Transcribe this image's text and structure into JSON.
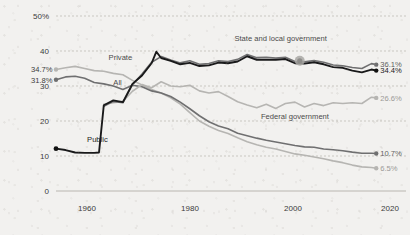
{
  "chart_data": {
    "type": "line",
    "title": "",
    "subtitle": "",
    "xlabel": "",
    "ylabel": "",
    "xlim": [
      1954,
      2022
    ],
    "ylim": [
      0,
      50
    ],
    "grid": true,
    "grid_style": "dashed-horizontal",
    "legend_position": "inline-annotations",
    "y_ticks": [
      "50%",
      "40",
      "30",
      "20",
      "10",
      "0"
    ],
    "y_tick_values": [
      50,
      40,
      30,
      20,
      10,
      0
    ],
    "x_ticks": [
      "1960",
      "1980",
      "2000",
      "2020"
    ],
    "x_tick_values": [
      1960,
      1980,
      2000,
      2020
    ],
    "series": [
      {
        "name": "Private",
        "color": "#b6b5b2",
        "style": "light",
        "start_label": "34.7%",
        "start_value": 34.7,
        "end_label": "6.5%",
        "end_value": 6.5,
        "inline_label": "Private",
        "x": [
          1954,
          1956,
          1958,
          1960,
          1962,
          1964,
          1966,
          1968,
          1970,
          1972,
          1974,
          1976,
          1978,
          1980,
          1982,
          1984,
          1986,
          1988,
          1990,
          1992,
          1994,
          1996,
          1998,
          2000,
          2002,
          2004,
          2006,
          2008,
          2010,
          2012,
          2014,
          2016,
          2018,
          2020,
          2021
        ],
        "values": [
          34.7,
          35.2,
          35.6,
          35.0,
          34.4,
          34.2,
          33.6,
          33.2,
          31.6,
          30.3,
          29.0,
          28.0,
          26.6,
          24.8,
          22.4,
          20.0,
          18.5,
          17.3,
          16.4,
          15.2,
          14.1,
          13.2,
          12.5,
          12.0,
          11.3,
          10.6,
          10.2,
          9.7,
          9.2,
          8.6,
          8.1,
          7.4,
          6.9,
          6.7,
          6.5
        ]
      },
      {
        "name": "All",
        "color": "#6f6f70",
        "style": "mid",
        "start_label": "31.8%",
        "start_value": 31.8,
        "end_label": "10.7%",
        "end_value": 10.7,
        "inline_label": "All",
        "x": [
          1954,
          1956,
          1958,
          1960,
          1962,
          1964,
          1966,
          1968,
          1970,
          1972,
          1974,
          1976,
          1978,
          1980,
          1982,
          1984,
          1986,
          1988,
          1990,
          1992,
          1994,
          1996,
          1998,
          2000,
          2002,
          2004,
          2006,
          2008,
          2010,
          2012,
          2014,
          2016,
          2018,
          2020,
          2021
        ],
        "values": [
          31.8,
          32.6,
          32.8,
          32.2,
          31.0,
          30.6,
          30.0,
          29.0,
          30.2,
          29.8,
          28.6,
          28.0,
          27.0,
          25.4,
          23.5,
          21.5,
          19.8,
          18.6,
          17.8,
          16.5,
          15.8,
          15.1,
          14.5,
          14.0,
          13.5,
          13.0,
          12.6,
          12.5,
          12.0,
          11.8,
          11.5,
          11.1,
          10.8,
          10.8,
          10.7
        ]
      },
      {
        "name": "Public",
        "color": "#19191a",
        "style": "dark",
        "start_label": "",
        "start_value": 12.1,
        "end_label": "34.4%",
        "end_value": 34.4,
        "inline_label": "Public",
        "x": [
          1954,
          1956,
          1958,
          1960,
          1962,
          1963,
          1964,
          1966,
          1968,
          1970,
          1972,
          1974,
          1975,
          1976,
          1978,
          1980,
          1982,
          1984,
          1986,
          1988,
          1990,
          1992,
          1994,
          1996,
          1998,
          2000,
          2002,
          2004,
          2006,
          2008,
          2010,
          2012,
          2014,
          2016,
          2018,
          2020,
          2021
        ],
        "values": [
          12.1,
          11.7,
          11.0,
          10.9,
          10.9,
          11.0,
          24.5,
          25.9,
          25.4,
          30.6,
          33.0,
          36.5,
          39.8,
          38.0,
          37.2,
          36.2,
          36.6,
          35.7,
          35.9,
          36.7,
          36.5,
          37.0,
          38.5,
          37.5,
          37.5,
          37.5,
          37.7,
          36.5,
          36.4,
          36.8,
          36.2,
          35.4,
          35.2,
          34.4,
          33.9,
          34.7,
          34.4
        ]
      },
      {
        "name": "State and local government",
        "color": "#6f6f70",
        "style": "mid",
        "start_label": "",
        "start_value": 24.2,
        "end_label": "36.1%",
        "end_value": 36.1,
        "inline_label": "State and local government",
        "x": [
          1964,
          1966,
          1968,
          1970,
          1972,
          1974,
          1976,
          1978,
          1980,
          1982,
          1984,
          1986,
          1988,
          1990,
          1992,
          1994,
          1996,
          1998,
          2000,
          2002,
          2004,
          2006,
          2008,
          2010,
          2012,
          2014,
          2016,
          2018,
          2020,
          2021
        ],
        "values": [
          24.2,
          25.6,
          25.2,
          30.4,
          33.4,
          36.8,
          38.4,
          37.4,
          36.6,
          37.2,
          36.2,
          36.4,
          37.2,
          37.0,
          37.6,
          39.0,
          38.1,
          38.2,
          38.0,
          38.2,
          37.0,
          36.9,
          37.3,
          36.8,
          36.0,
          35.8,
          35.3,
          35.0,
          36.4,
          36.1
        ]
      },
      {
        "name": "Federal government",
        "color": "#b6b5b2",
        "style": "light",
        "start_label": "",
        "start_value": 24.8,
        "end_label": "26.6%",
        "end_value": 26.6,
        "inline_label": "Federal government",
        "x": [
          1964,
          1966,
          1968,
          1970,
          1972,
          1974,
          1976,
          1978,
          1980,
          1982,
          1984,
          1986,
          1988,
          1990,
          1992,
          1994,
          1996,
          1998,
          2000,
          2002,
          2004,
          2006,
          2008,
          2010,
          2012,
          2014,
          2016,
          2018,
          2020,
          2021
        ],
        "values": [
          24.8,
          25.2,
          25.6,
          28.5,
          30.4,
          29.5,
          31.2,
          30.0,
          29.8,
          30.2,
          28.6,
          28.0,
          28.4,
          27.0,
          25.5,
          24.6,
          23.8,
          24.8,
          23.6,
          25.0,
          25.4,
          24.0,
          25.0,
          24.4,
          25.2,
          25.0,
          25.2,
          25.0,
          26.8,
          26.6
        ]
      }
    ],
    "annotations": [
      {
        "text": "Private",
        "x": 1965,
        "y": 37.5,
        "name": "private"
      },
      {
        "text": "All",
        "x": 1966,
        "y": 30.3,
        "name": "all"
      },
      {
        "text": "Public",
        "x": 1960.5,
        "y": 14.0,
        "name": "public"
      },
      {
        "text": "State and local government",
        "x": 2001,
        "y": 43.0,
        "name": "state-local"
      },
      {
        "text": "Federal government",
        "x": 2004,
        "y": 20.5,
        "name": "federal"
      }
    ],
    "highlight_marker": {
      "x": 2005,
      "y": 37.2,
      "series": "State and local government"
    }
  }
}
